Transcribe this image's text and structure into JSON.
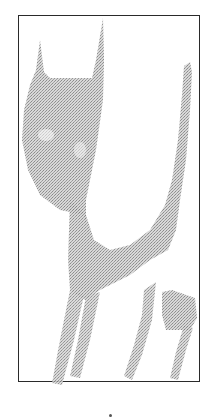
{
  "figure": {
    "frame_color": "#2a2a2a",
    "fill_color": "#a8a8a8",
    "background": "#ffffff"
  }
}
